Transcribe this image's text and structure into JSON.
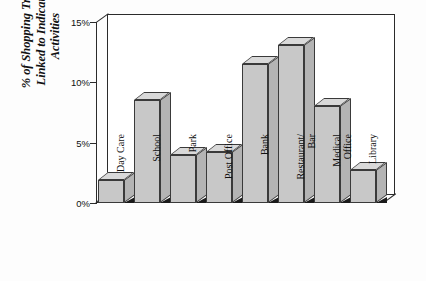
{
  "chart_data": {
    "type": "bar",
    "title": "",
    "xlabel": "",
    "ylabel": "% of Shopping Trips Linked to Indicated Activities",
    "ylabel_lines": [
      "% of Shopping Trips",
      "Linked to Indicated",
      "Activities"
    ],
    "categories": [
      "Day Care",
      "School",
      "Park",
      "Post Office",
      "Bank",
      "Restaurant/\nBar",
      "Medical\nOffice",
      "Library"
    ],
    "values": [
      1.9,
      8.5,
      4.0,
      4.2,
      11.5,
      13.1,
      8.0,
      2.7
    ],
    "ylim": [
      0,
      15
    ],
    "yticks": [
      0,
      5,
      10,
      15
    ],
    "ytick_labels": [
      "0%",
      "5%",
      "10%",
      "15%"
    ],
    "grid": false,
    "legend": null,
    "style": "3d-bar",
    "bar_color": "#c8c8c8",
    "bar_top_color": "#d9d9d9",
    "bar_side_color": "#b4b4b4",
    "frame_color": "#2b2b2b",
    "plot_background": "#ffffff"
  }
}
